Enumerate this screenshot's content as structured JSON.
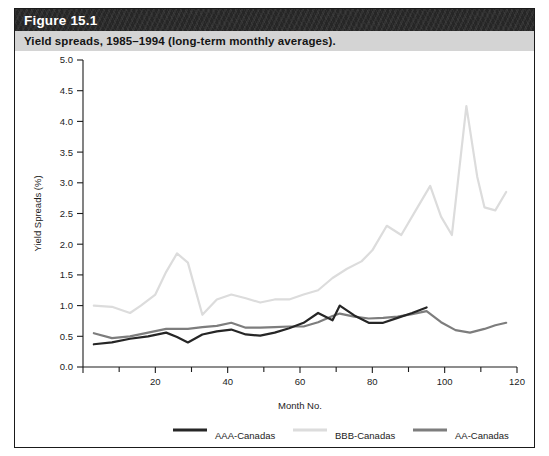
{
  "figure": {
    "header_title": "Figure 15.1",
    "caption": "Yield spreads, 1985–1994 (long-term monthly averages)."
  },
  "chart_data": {
    "type": "line",
    "title": "Yield spreads, 1985–1994 (long-term monthly averages).",
    "xlabel": "Month No.",
    "ylabel": "Yield Spreads (%)",
    "xlim": [
      0,
      120
    ],
    "ylim": [
      0,
      5.0
    ],
    "xticks": [
      0,
      20,
      40,
      60,
      80,
      100,
      120
    ],
    "xtick_labels": [
      "",
      "20",
      "40",
      "60",
      "80",
      "100",
      "120"
    ],
    "xminor_ticks": [
      10,
      30,
      50,
      70,
      90,
      110
    ],
    "yticks": [
      0.0,
      0.5,
      1.0,
      1.5,
      2.0,
      2.5,
      3.0,
      3.5,
      4.0,
      4.5,
      5.0
    ],
    "ytick_labels": [
      "0.0",
      "0.5",
      "1.0",
      "1.5",
      "2.0",
      "2.5",
      "3.0",
      "3.5",
      "4.0",
      "4.5",
      "5.0"
    ],
    "grid": false,
    "legend_position": "bottom",
    "series": [
      {
        "name": "AAA-Canadas",
        "color": "#262626",
        "width": 2.2,
        "x": [
          3,
          8,
          13,
          18,
          23,
          26,
          29,
          33,
          37,
          41,
          45,
          49,
          53,
          57,
          61,
          65,
          69,
          71,
          75,
          79,
          83,
          87,
          91,
          95
        ],
        "values": [
          0.37,
          0.4,
          0.46,
          0.5,
          0.56,
          0.49,
          0.4,
          0.53,
          0.58,
          0.61,
          0.53,
          0.51,
          0.56,
          0.63,
          0.72,
          0.88,
          0.76,
          1.0,
          0.84,
          0.72,
          0.72,
          0.8,
          0.88,
          0.97
        ]
      },
      {
        "name": "BBB-Canadas",
        "color": "#dcdcdc",
        "width": 2.2,
        "x": [
          3,
          8,
          13,
          16,
          20,
          23,
          26,
          29,
          33,
          37,
          41,
          45,
          49,
          53,
          57,
          61,
          65,
          69,
          73,
          77,
          80,
          84,
          88,
          92,
          96,
          99,
          102,
          106,
          109,
          111,
          114,
          117
        ],
        "values": [
          1.0,
          0.98,
          0.88,
          1.0,
          1.18,
          1.55,
          1.85,
          1.7,
          0.85,
          1.1,
          1.18,
          1.12,
          1.05,
          1.1,
          1.1,
          1.18,
          1.25,
          1.45,
          1.6,
          1.72,
          1.9,
          2.3,
          2.15,
          2.55,
          2.95,
          2.45,
          2.15,
          4.25,
          3.1,
          2.6,
          2.55,
          2.85
        ]
      },
      {
        "name": "AA-Canadas",
        "color": "#7d7d7d",
        "width": 2.2,
        "x": [
          3,
          8,
          13,
          18,
          23,
          26,
          29,
          33,
          37,
          41,
          45,
          49,
          53,
          57,
          61,
          65,
          69,
          71,
          75,
          79,
          83,
          87,
          91,
          95,
          99,
          103,
          107,
          111,
          114,
          117
        ],
        "values": [
          0.55,
          0.47,
          0.5,
          0.56,
          0.62,
          0.62,
          0.62,
          0.65,
          0.67,
          0.72,
          0.64,
          0.64,
          0.65,
          0.66,
          0.66,
          0.73,
          0.83,
          0.87,
          0.82,
          0.79,
          0.8,
          0.82,
          0.86,
          0.91,
          0.73,
          0.6,
          0.56,
          0.62,
          0.68,
          0.72
        ]
      }
    ]
  },
  "legend": {
    "items": [
      {
        "label": "AAA-Canadas",
        "color": "#262626"
      },
      {
        "label": "BBB-Canadas",
        "color": "#dcdcdc"
      },
      {
        "label": "AA-Canadas",
        "color": "#7d7d7d"
      }
    ]
  }
}
